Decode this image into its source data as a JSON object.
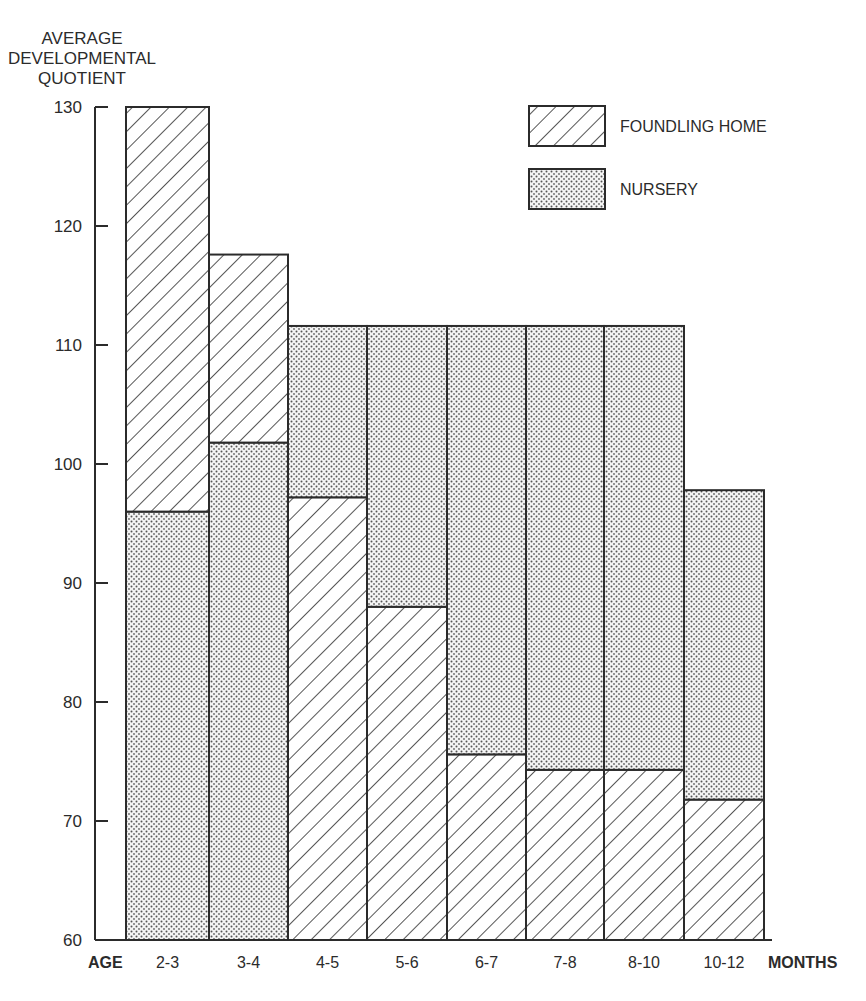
{
  "chart_data": {
    "type": "bar",
    "subtype": "overlapped-range",
    "title": "",
    "ylabel_lines": [
      "AVERAGE",
      "DEVELOPMENTAL",
      "QUOTIENT"
    ],
    "xlabel_left": "AGE",
    "xlabel_right": "MONTHS",
    "ylim": [
      60,
      130
    ],
    "yticks": [
      60,
      70,
      80,
      90,
      100,
      110,
      120,
      130
    ],
    "grid": false,
    "legend_position": "top-right",
    "categories": [
      "2-3",
      "3-4",
      "4-5",
      "5-6",
      "6-7",
      "7-8",
      "8-10",
      "10-12"
    ],
    "series": [
      {
        "name": "FOUNDLING HOME",
        "pattern": "diagonal-hatch",
        "values": [
          130,
          117.6,
          97.2,
          88,
          75.6,
          74.3,
          74.3,
          71.8
        ]
      },
      {
        "name": "NURSERY",
        "pattern": "dot-stipple",
        "values": [
          96,
          101.8,
          111.6,
          111.6,
          111.6,
          111.6,
          111.6,
          97.8
        ]
      }
    ]
  }
}
